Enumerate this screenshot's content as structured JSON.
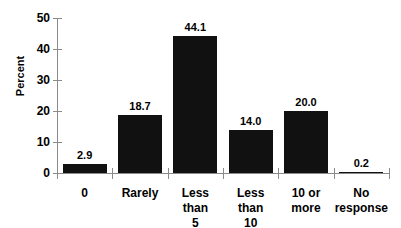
{
  "chart_data": {
    "type": "bar",
    "title": "",
    "subtitle": "",
    "xlabel": "",
    "ylabel": "Percent",
    "ylim": [
      0,
      50
    ],
    "yticks": [
      0,
      10,
      20,
      30,
      40,
      50
    ],
    "grid": false,
    "legend": null,
    "bar_color": "#111111",
    "axis_color": "#8a8a8a",
    "background": "#ffffff",
    "value_labels_shown": true,
    "categories": [
      "0",
      "Rarely",
      "Less than 5",
      "Less than 10",
      "10 or more",
      "No response"
    ],
    "category_lines": [
      [
        "0"
      ],
      [
        "Rarely"
      ],
      [
        "Less than",
        "5"
      ],
      [
        "Less than",
        "10"
      ],
      [
        "10 or",
        "more"
      ],
      [
        "No",
        "response"
      ]
    ],
    "values": [
      2.9,
      18.7,
      44.1,
      14.0,
      20.0,
      0.2
    ],
    "value_labels": [
      "2.9",
      "18.7",
      "44.1",
      "14.0",
      "20.0",
      "0.2"
    ]
  },
  "axis": {
    "y_tick_labels": [
      "50",
      "40",
      "30",
      "20",
      "10",
      "0"
    ],
    "y_title": "Percent"
  }
}
